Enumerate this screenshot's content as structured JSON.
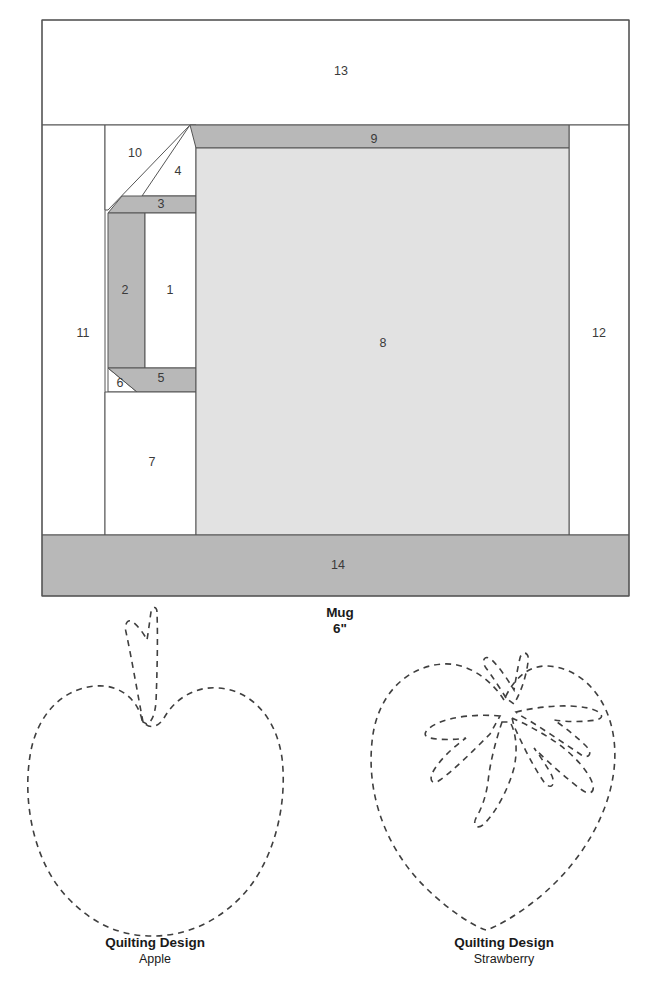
{
  "block": {
    "title": "Mug",
    "size_label": "6\"",
    "colors": {
      "background": "#ffffff",
      "light_fabric": "#ffffff",
      "medium_fabric": "#e2e2e2",
      "dark_fabric": "#b8b8b8",
      "seam_line": "#555555",
      "number_text": "#3a3a3a"
    },
    "pieces": [
      {
        "number": "1",
        "fabric": "light",
        "label_x": 170,
        "label_y": 291
      },
      {
        "number": "2",
        "fabric": "dark",
        "label_x": 125,
        "label_y": 291
      },
      {
        "number": "3",
        "fabric": "dark",
        "label_x": 161,
        "label_y": 205
      },
      {
        "number": "4",
        "fabric": "light",
        "label_x": 178,
        "label_y": 172
      },
      {
        "number": "5",
        "fabric": "dark",
        "label_x": 161,
        "label_y": 379
      },
      {
        "number": "6",
        "fabric": "light",
        "label_x": 120,
        "label_y": 384
      },
      {
        "number": "7",
        "fabric": "light",
        "label_x": 152,
        "label_y": 463
      },
      {
        "number": "8",
        "fabric": "medium",
        "label_x": 383,
        "label_y": 344
      },
      {
        "number": "9",
        "fabric": "dark",
        "label_x": 374,
        "label_y": 140
      },
      {
        "number": "10",
        "fabric": "light",
        "label_x": 135,
        "label_y": 154
      },
      {
        "number": "11",
        "fabric": "light",
        "label_x": 83,
        "label_y": 334
      },
      {
        "number": "12",
        "fabric": "light",
        "label_x": 599,
        "label_y": 334
      },
      {
        "number": "13",
        "fabric": "light",
        "label_x": 341,
        "label_y": 72
      },
      {
        "number": "14",
        "fabric": "dark",
        "label_x": 338,
        "label_y": 566
      }
    ]
  },
  "quilting_designs": [
    {
      "id": "apple",
      "heading": "Quilting Design",
      "name": "Apple",
      "heading_x": 155,
      "heading_y": 947,
      "name_x": 155,
      "name_y": 963
    },
    {
      "id": "strawberry",
      "heading": "Quilting Design",
      "name": "Strawberry",
      "heading_x": 504,
      "heading_y": 947,
      "name_x": 504,
      "name_y": 963
    }
  ]
}
